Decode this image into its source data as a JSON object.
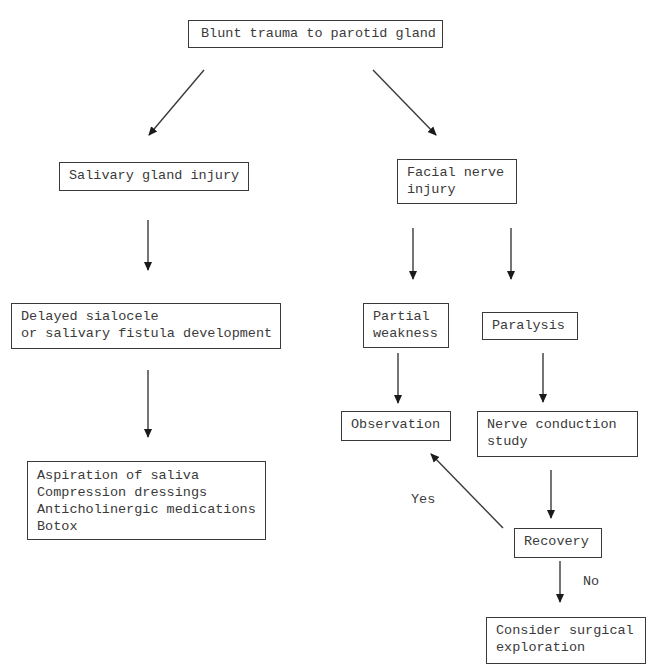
{
  "diagram": {
    "type": "flowchart",
    "nodes": {
      "root": {
        "text": "Blunt trauma to parotid gland"
      },
      "salivary": {
        "text": "Salivary gland injury"
      },
      "facial": {
        "text": "Facial nerve\ninjury"
      },
      "delayed": {
        "text": "Delayed sialocele\nor salivary fistula development"
      },
      "partial": {
        "text": "Partial\nweakness"
      },
      "paralysis": {
        "text": "Paralysis"
      },
      "observation": {
        "text": "Observation"
      },
      "nerve_study": {
        "text": "Nerve conduction\nstudy"
      },
      "treatment": {
        "text": "Aspiration of saliva\nCompression dressings\nAnticholinergic medications\nBotox"
      },
      "recovery": {
        "text": "Recovery"
      },
      "surgery": {
        "text": "Consider surgical\nexploration"
      }
    },
    "edge_labels": {
      "yes": "Yes",
      "no": "No"
    },
    "edges": [
      {
        "from": "root",
        "to": "salivary"
      },
      {
        "from": "root",
        "to": "facial"
      },
      {
        "from": "salivary",
        "to": "delayed"
      },
      {
        "from": "facial",
        "to": "partial"
      },
      {
        "from": "facial",
        "to": "paralysis"
      },
      {
        "from": "delayed",
        "to": "treatment"
      },
      {
        "from": "partial",
        "to": "observation"
      },
      {
        "from": "paralysis",
        "to": "nerve_study"
      },
      {
        "from": "nerve_study",
        "to": "recovery"
      },
      {
        "from": "recovery",
        "to": "observation",
        "label": "Yes"
      },
      {
        "from": "recovery",
        "to": "surgery",
        "label": "No"
      }
    ],
    "colors": {
      "line": "#3a3a3a",
      "background": "#ffffff"
    }
  }
}
